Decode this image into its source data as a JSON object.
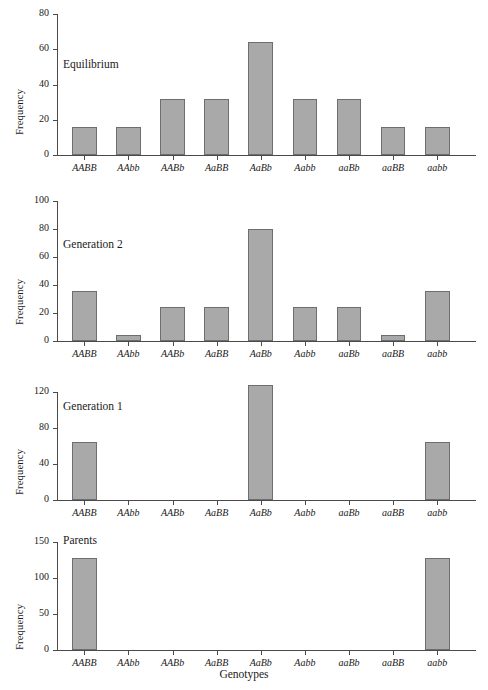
{
  "figure": {
    "xlabel": "Genotypes",
    "ylabel": "Frequency",
    "bar_color": "#a9a9a9",
    "bar_edge_color": "#6e6e6e",
    "axis_color": "#4a4a4a",
    "background": "#ffffff"
  },
  "categories": [
    "AABB",
    "AAbb",
    "AABb",
    "AaBB",
    "AaBb",
    "Aabb",
    "aaBb",
    "aaBB",
    "aabb"
  ],
  "chart_data": [
    {
      "type": "bar",
      "title": "Equilibrium",
      "xlabel": "",
      "ylabel": "Frequency",
      "categories": [
        "AABB",
        "AAbb",
        "AABb",
        "AaBB",
        "AaBb",
        "Aabb",
        "aaBb",
        "aaBB",
        "aabb"
      ],
      "values": [
        16,
        16,
        32,
        32,
        64,
        32,
        32,
        16,
        16
      ],
      "ylim": [
        0,
        80
      ],
      "yticks": [
        0,
        20,
        40,
        60,
        80
      ],
      "grid": false,
      "legend": "none"
    },
    {
      "type": "bar",
      "title": "Generation 2",
      "xlabel": "",
      "ylabel": "Frequency",
      "categories": [
        "AABB",
        "AAbb",
        "AABb",
        "AaBB",
        "AaBb",
        "Aabb",
        "aaBb",
        "aaBB",
        "aabb"
      ],
      "values": [
        36,
        4,
        24,
        24,
        80,
        24,
        24,
        4,
        36
      ],
      "ylim": [
        0,
        100
      ],
      "yticks": [
        0,
        20,
        40,
        60,
        80,
        100
      ],
      "grid": false,
      "legend": "none"
    },
    {
      "type": "bar",
      "title": "Generation 1",
      "xlabel": "",
      "ylabel": "Frequency",
      "categories": [
        "AABB",
        "AAbb",
        "AABb",
        "AaBB",
        "AaBb",
        "Aabb",
        "aaBb",
        "aaBB",
        "aabb"
      ],
      "values": [
        64,
        0,
        0,
        0,
        128,
        0,
        0,
        0,
        64
      ],
      "ylim": [
        0,
        130
      ],
      "yticks": [
        0,
        40,
        80,
        120
      ],
      "grid": false,
      "legend": "none"
    },
    {
      "type": "bar",
      "title": "Parents",
      "xlabel": "Genotypes",
      "ylabel": "Frequency",
      "categories": [
        "AABB",
        "AAbb",
        "AABb",
        "AaBB",
        "AaBb",
        "Aabb",
        "aaBb",
        "aaBB",
        "aabb"
      ],
      "values": [
        128,
        0,
        0,
        0,
        0,
        0,
        0,
        0,
        128
      ],
      "ylim": [
        0,
        155
      ],
      "yticks": [
        0,
        50,
        100,
        150
      ],
      "grid": false,
      "legend": "none"
    }
  ]
}
